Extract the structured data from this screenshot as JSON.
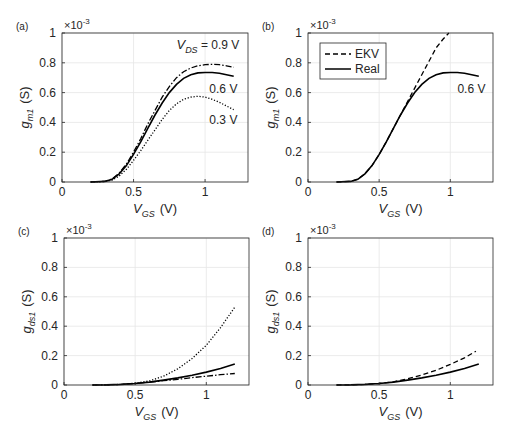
{
  "figure": {
    "width": 510,
    "height": 432,
    "colors": {
      "axis": "#262626",
      "grid": "#e6e6e6",
      "line": "#000000",
      "background": "#ffffff"
    }
  },
  "chart_data": [
    {
      "panel": "(a)",
      "type": "line",
      "box": {
        "left": 62,
        "top": 33,
        "right": 248,
        "bottom": 182
      },
      "xlim": [
        0,
        1.3
      ],
      "ylim": [
        0,
        1
      ],
      "xticks": [
        0,
        0.5,
        1
      ],
      "xticklabels": [
        "0",
        "0.5",
        "1"
      ],
      "yticks": [
        0,
        0.2,
        0.4,
        0.6,
        0.8,
        1
      ],
      "yticklabels": [
        "0",
        "0.2",
        "0.4",
        "0.6",
        "0.8",
        "1"
      ],
      "exponent_label": "×10",
      "exponent": "-3",
      "xlabel": {
        "main": "V",
        "sub": "GS",
        "unit": "(V)"
      },
      "ylabel": {
        "main": "g",
        "sub": "m1",
        "unit": "(S)"
      },
      "grid": true,
      "series": [
        {
          "name": "VDS = 0.9 V",
          "style": "dashdot",
          "x": [
            0.2,
            0.3,
            0.35,
            0.4,
            0.45,
            0.5,
            0.55,
            0.6,
            0.65,
            0.7,
            0.75,
            0.8,
            0.85,
            0.9,
            0.95,
            1.0,
            1.05,
            1.1,
            1.15,
            1.2
          ],
          "y": [
            0,
            0.005,
            0.02,
            0.06,
            0.12,
            0.2,
            0.29,
            0.39,
            0.48,
            0.57,
            0.64,
            0.7,
            0.74,
            0.765,
            0.78,
            0.787,
            0.79,
            0.787,
            0.78,
            0.77
          ]
        },
        {
          "name": "VDS = 0.6 V",
          "style": "solid",
          "x": [
            0.2,
            0.3,
            0.35,
            0.4,
            0.45,
            0.5,
            0.55,
            0.6,
            0.65,
            0.7,
            0.75,
            0.8,
            0.85,
            0.9,
            0.95,
            1.0,
            1.05,
            1.1,
            1.15,
            1.2
          ],
          "y": [
            0,
            0.004,
            0.018,
            0.055,
            0.11,
            0.185,
            0.27,
            0.36,
            0.45,
            0.53,
            0.6,
            0.655,
            0.695,
            0.72,
            0.732,
            0.735,
            0.735,
            0.73,
            0.72,
            0.71
          ]
        },
        {
          "name": "VDS = 0.3 V",
          "style": "dotted",
          "x": [
            0.2,
            0.3,
            0.35,
            0.4,
            0.45,
            0.5,
            0.55,
            0.6,
            0.65,
            0.7,
            0.75,
            0.8,
            0.85,
            0.9,
            0.95,
            1.0,
            1.05,
            1.1,
            1.15,
            1.2
          ],
          "y": [
            0,
            0.003,
            0.013,
            0.04,
            0.085,
            0.145,
            0.21,
            0.28,
            0.35,
            0.42,
            0.48,
            0.525,
            0.555,
            0.57,
            0.575,
            0.57,
            0.555,
            0.535,
            0.51,
            0.485
          ]
        }
      ],
      "annotations": [
        {
          "text": "V",
          "sub": "DS",
          "suffix": " = 0.9 V",
          "x": 0.8,
          "y": 0.895
        },
        {
          "text": "0.6 V",
          "x": 1.03,
          "y": 0.6
        },
        {
          "text": "0.3 V",
          "x": 1.03,
          "y": 0.39
        }
      ]
    },
    {
      "panel": "(b)",
      "type": "line",
      "box": {
        "left": 308,
        "top": 33,
        "right": 493,
        "bottom": 182
      },
      "xlim": [
        0,
        1.3
      ],
      "ylim": [
        0,
        1
      ],
      "xticks": [
        0,
        0.5,
        1
      ],
      "xticklabels": [
        "0",
        "0.5",
        "1"
      ],
      "yticks": [
        0,
        0.2,
        0.4,
        0.6,
        0.8,
        1
      ],
      "yticklabels": [
        "0",
        "0.2",
        "0.4",
        "0.6",
        "0.8",
        "1"
      ],
      "exponent_label": "×10",
      "exponent": "-3",
      "xlabel": {
        "main": "V",
        "sub": "GS",
        "unit": "(V)"
      },
      "ylabel": {
        "main": "g",
        "sub": "m1",
        "unit": "(S)"
      },
      "grid": true,
      "legend": {
        "position": "upper-left",
        "entries": [
          {
            "label": "EKV",
            "style": "dashed"
          },
          {
            "label": "Real",
            "style": "solid"
          }
        ]
      },
      "series": [
        {
          "name": "EKV",
          "style": "dashed",
          "x": [
            0.2,
            0.3,
            0.35,
            0.4,
            0.45,
            0.5,
            0.55,
            0.6,
            0.65,
            0.7,
            0.75,
            0.8,
            0.85,
            0.9,
            0.95,
            0.99
          ],
          "y": [
            0,
            0.004,
            0.018,
            0.055,
            0.11,
            0.185,
            0.27,
            0.36,
            0.45,
            0.54,
            0.63,
            0.72,
            0.81,
            0.9,
            0.96,
            1.0
          ]
        },
        {
          "name": "Real",
          "style": "solid",
          "x": [
            0.2,
            0.3,
            0.35,
            0.4,
            0.45,
            0.5,
            0.55,
            0.6,
            0.65,
            0.7,
            0.75,
            0.8,
            0.85,
            0.9,
            0.95,
            1.0,
            1.05,
            1.1,
            1.15,
            1.2
          ],
          "y": [
            0,
            0.004,
            0.018,
            0.055,
            0.11,
            0.185,
            0.27,
            0.36,
            0.45,
            0.53,
            0.6,
            0.655,
            0.695,
            0.72,
            0.732,
            0.735,
            0.735,
            0.73,
            0.72,
            0.71
          ]
        }
      ],
      "annotations": [
        {
          "text": "0.6 V",
          "x": 1.05,
          "y": 0.6
        }
      ]
    },
    {
      "panel": "(c)",
      "type": "line",
      "box": {
        "left": 64,
        "top": 238,
        "right": 249,
        "bottom": 385
      },
      "xlim": [
        0,
        1.3
      ],
      "ylim": [
        0,
        1
      ],
      "xticks": [
        0,
        0.5,
        1
      ],
      "xticklabels": [
        "0",
        "0.5",
        "1"
      ],
      "yticks": [
        0,
        0.2,
        0.4,
        0.6,
        0.8,
        1
      ],
      "yticklabels": [
        "0",
        "0.2",
        "0.4",
        "0.6",
        "0.8",
        "1"
      ],
      "exponent_label": "×10",
      "exponent": "-3",
      "xlabel": {
        "main": "V",
        "sub": "GS",
        "unit": "(V)"
      },
      "ylabel": {
        "main": "g",
        "sub": "ds1",
        "unit": "(S)"
      },
      "grid": true,
      "series": [
        {
          "name": "VDS = 0.3 V",
          "style": "dotted",
          "x": [
            0.2,
            0.3,
            0.4,
            0.5,
            0.6,
            0.7,
            0.8,
            0.9,
            1.0,
            1.1,
            1.2
          ],
          "y": [
            0,
            0.001,
            0.004,
            0.012,
            0.028,
            0.06,
            0.11,
            0.18,
            0.27,
            0.39,
            0.53
          ]
        },
        {
          "name": "VDS = 0.6 V",
          "style": "solid",
          "x": [
            0.2,
            0.3,
            0.4,
            0.5,
            0.6,
            0.7,
            0.8,
            0.9,
            1.0,
            1.1,
            1.2
          ],
          "y": [
            0,
            0.001,
            0.004,
            0.01,
            0.02,
            0.033,
            0.048,
            0.066,
            0.088,
            0.113,
            0.142
          ]
        },
        {
          "name": "VDS = 0.9 V",
          "style": "dashdot",
          "x": [
            0.2,
            0.3,
            0.4,
            0.5,
            0.6,
            0.7,
            0.8,
            0.9,
            1.0,
            1.1,
            1.2
          ],
          "y": [
            0,
            0.001,
            0.004,
            0.01,
            0.019,
            0.029,
            0.039,
            0.05,
            0.06,
            0.07,
            0.078
          ]
        }
      ]
    },
    {
      "panel": "(d)",
      "type": "line",
      "box": {
        "left": 308,
        "top": 238,
        "right": 493,
        "bottom": 385
      },
      "xlim": [
        0,
        1.3
      ],
      "ylim": [
        0,
        1
      ],
      "xticks": [
        0,
        0.5,
        1
      ],
      "xticklabels": [
        "0",
        "0.5",
        "1"
      ],
      "yticks": [
        0,
        0.2,
        0.4,
        0.6,
        0.8,
        1
      ],
      "yticklabels": [
        "0",
        "0.2",
        "0.4",
        "0.6",
        "0.8",
        "1"
      ],
      "exponent_label": "×10",
      "exponent": "-3",
      "xlabel": {
        "main": "V",
        "sub": "GS",
        "unit": "(V)"
      },
      "ylabel": {
        "main": "g",
        "sub": "ds1",
        "unit": "(S)"
      },
      "grid": true,
      "series": [
        {
          "name": "EKV",
          "style": "dashed",
          "x": [
            0.2,
            0.3,
            0.4,
            0.5,
            0.6,
            0.7,
            0.8,
            0.9,
            1.0,
            1.1,
            1.18
          ],
          "y": [
            0,
            0.001,
            0.004,
            0.01,
            0.022,
            0.042,
            0.068,
            0.1,
            0.14,
            0.185,
            0.23
          ]
        },
        {
          "name": "Real",
          "style": "solid",
          "x": [
            0.2,
            0.3,
            0.4,
            0.5,
            0.6,
            0.7,
            0.8,
            0.9,
            1.0,
            1.1,
            1.2
          ],
          "y": [
            0,
            0.001,
            0.004,
            0.01,
            0.02,
            0.033,
            0.048,
            0.066,
            0.088,
            0.113,
            0.142
          ]
        }
      ]
    }
  ]
}
